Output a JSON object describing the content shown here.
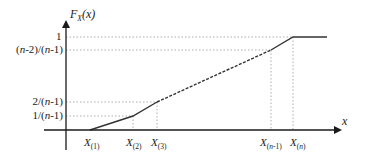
{
  "diagram": {
    "y_axis": {
      "label_main": "F",
      "label_sub": "X",
      "label_arg": "(x)"
    },
    "x_axis": {
      "label": "x"
    },
    "y_ticks": [
      {
        "id": "one",
        "label": "1"
      },
      {
        "id": "n2n1",
        "label_parts": [
          "(",
          "n",
          "-2)/(",
          "n",
          "-1)"
        ]
      },
      {
        "id": "two",
        "label_parts": [
          "2/(",
          "n",
          "-1)"
        ]
      },
      {
        "id": "onen",
        "label_parts": [
          "1/(",
          "n",
          "-1)"
        ]
      }
    ],
    "x_ticks": [
      {
        "id": "x1",
        "main": "X",
        "sub": "(1)"
      },
      {
        "id": "x2",
        "main": "X",
        "sub": "(2)"
      },
      {
        "id": "x3",
        "main": "X",
        "sub": "(3)"
      },
      {
        "id": "xn1",
        "main": "X",
        "sub_parts": [
          "(",
          "n",
          "-1)"
        ]
      },
      {
        "id": "xn",
        "main": "X",
        "sub_parts": [
          "(",
          "n",
          ")"
        ]
      }
    ],
    "curve_points": [
      {
        "x": "X(1)",
        "y": "0"
      },
      {
        "x": "X(2)",
        "y": "1/(n-1)"
      },
      {
        "x": "X(3)",
        "y": "2/(n-1)"
      },
      {
        "x": "X(n-1)",
        "y": "(n-2)/(n-1)",
        "segment_style": "dashed"
      },
      {
        "x": "X(n)",
        "y": "1"
      },
      {
        "x": "beyond",
        "y": "1"
      }
    ],
    "colors": {
      "axis": "#1a1a1a",
      "curve": "#333333",
      "guide": "#999999"
    }
  }
}
